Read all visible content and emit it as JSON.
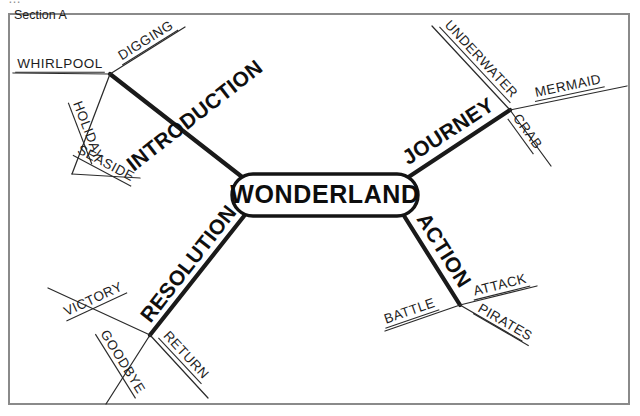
{
  "canvas": {
    "width": 640,
    "height": 416,
    "background": "#ffffff",
    "frame_border_color": "#8a8a8a"
  },
  "clipped_artifact": {
    "text": "…"
  },
  "section": {
    "label": "Section A"
  },
  "center": {
    "label": "WONDERLAND",
    "shape": "rounded-rectangle",
    "fill": "#ffffff",
    "stroke": "#141414"
  },
  "chart_data": {
    "type": "diagram",
    "diagram_kind": "mind-map",
    "title": "Section A",
    "root": "WONDERLAND",
    "branches": [
      {
        "label": "INTRODUCTION",
        "direction": "up-left",
        "children": [
          "DIGGING",
          "WHIRLPOOL",
          "HOLIDAY",
          "SEASIDE"
        ]
      },
      {
        "label": "JOURNEY",
        "direction": "up-right",
        "children": [
          "UNDERWATER",
          "MERMAID",
          "CRAB"
        ]
      },
      {
        "label": "RESOLUTION",
        "direction": "down-left",
        "children": [
          "VICTORY",
          "GOODBYE",
          "RETURN"
        ]
      },
      {
        "label": "ACTION",
        "direction": "down-right",
        "children": [
          "ATTACK",
          "BATTLE",
          "PIRATES"
        ]
      }
    ]
  },
  "branches": {
    "introduction": {
      "label": "INTRODUCTION",
      "sub": {
        "digging": "DIGGING",
        "whirlpool": "WHIRLPOOL",
        "holiday": "HOLIDAY",
        "seaside": "SEASIDE"
      }
    },
    "journey": {
      "label": "JOURNEY",
      "sub": {
        "underwater": "UNDERWATER",
        "mermaid": "MERMAID",
        "crab": "CRAB"
      }
    },
    "resolution": {
      "label": "RESOLUTION",
      "sub": {
        "victory": "VICTORY",
        "goodbye": "GOODBYE",
        "return": "RETURN"
      }
    },
    "action": {
      "label": "ACTION",
      "sub": {
        "attack": "ATTACK",
        "battle": "BATTLE",
        "pirates": "PIRATES"
      }
    }
  }
}
